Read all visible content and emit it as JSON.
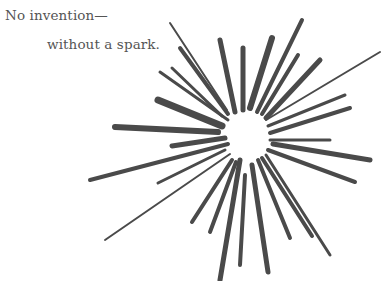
{
  "caption": {
    "line1": "No invention—",
    "line2": "without a spark."
  },
  "illustration": {
    "name": "spark-burst",
    "ink_color": "#4a4a4a",
    "center": [
      245,
      135
    ]
  }
}
